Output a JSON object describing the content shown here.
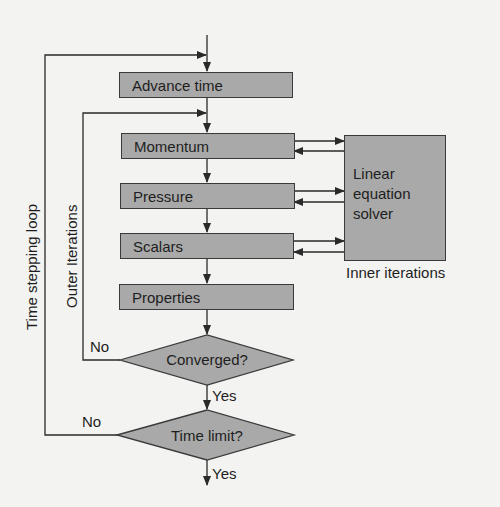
{
  "diagram": {
    "type": "flowchart",
    "steps": [
      {
        "id": "advance",
        "label": "Advance time"
      },
      {
        "id": "momentum",
        "label": "Momentum"
      },
      {
        "id": "pressure",
        "label": "Pressure"
      },
      {
        "id": "scalars",
        "label": "Scalars"
      },
      {
        "id": "properties",
        "label": "Properties"
      }
    ],
    "decisions": [
      {
        "id": "converged",
        "label": "Converged?",
        "yes": "Yes",
        "no": "No"
      },
      {
        "id": "timelimit",
        "label": "Time limit?",
        "yes": "Yes",
        "no": "No"
      }
    ],
    "solver": {
      "lines": [
        "Linear",
        "equation",
        "solver"
      ],
      "caption": "Inner iterations"
    },
    "loops": {
      "time": "Time stepping loop",
      "outer": "Outer Iterations"
    },
    "colors": {
      "box_fill": "#a9a9a9",
      "line": "#2a2a2a",
      "background": "#f3f3f1"
    }
  }
}
